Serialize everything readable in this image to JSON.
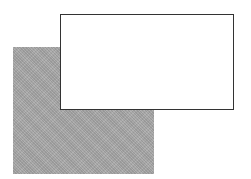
{
  "diagram": {
    "shapes": [
      {
        "id": "shadow-rect",
        "kind": "rectangle",
        "fill": "stippled-gray",
        "color": "#a9a9a9",
        "x": 13,
        "y": 47,
        "width": 141,
        "height": 127,
        "layer": "back"
      },
      {
        "id": "front-rect",
        "kind": "rectangle",
        "fill": "white",
        "color": "#ffffff",
        "stroke": "#333333",
        "x": 60,
        "y": 14,
        "width": 174,
        "height": 96,
        "layer": "front"
      }
    ],
    "text": []
  }
}
